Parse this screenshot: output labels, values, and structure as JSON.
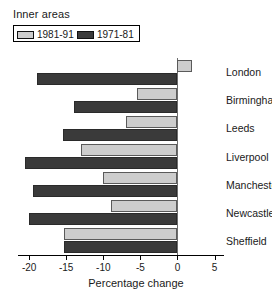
{
  "legend": {
    "title": "Inner areas",
    "entries": [
      {
        "label": "1981-91",
        "color": "#cdcdcd",
        "series": "1981-91"
      },
      {
        "label": "1971-81",
        "color": "#3a3a3a",
        "series": "1971-81"
      }
    ]
  },
  "axis": {
    "xlabel": "Percentage change",
    "ticks": [
      "-20",
      "-15",
      "-10",
      "-5",
      "0",
      "5"
    ]
  },
  "categories": [
    "London",
    "Birmingham",
    "Leeds",
    "Liverpool",
    "Manchester",
    "Newcastle",
    "Sheffield"
  ],
  "chart_data": {
    "type": "bar",
    "orientation": "horizontal",
    "title": "Inner areas",
    "xlabel": "Percentage change",
    "ylabel": "",
    "xlim": [
      -21.5,
      6
    ],
    "xticks": [
      -20,
      -15,
      -10,
      -5,
      0,
      5
    ],
    "grid": false,
    "legend_position": "top-left",
    "categories": [
      "London",
      "Birmingham",
      "Leeds",
      "Liverpool",
      "Manchester",
      "Newcastle",
      "Sheffield"
    ],
    "series": [
      {
        "name": "1981-91",
        "color": "#cdcdcd",
        "values": [
          2.0,
          -5.5,
          -7.0,
          -13.0,
          -10.0,
          -9.0,
          -15.3
        ]
      },
      {
        "name": "1971-81",
        "color": "#3a3a3a",
        "values": [
          -19.0,
          -14.0,
          -15.5,
          -20.5,
          -19.5,
          -20.0,
          -15.3
        ]
      }
    ]
  }
}
